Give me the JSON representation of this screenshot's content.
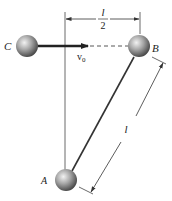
{
  "diagram": {
    "labels": {
      "ball_c": "C",
      "ball_b": "B",
      "ball_a": "A",
      "velocity": "v",
      "velocity_sub": "0",
      "half_length_num": "l",
      "half_length_den": "2",
      "rod_length": "l"
    },
    "colors": {
      "line": "#333333",
      "ball_light": "#e8e8e8",
      "ball_mid": "#9a9a9a",
      "ball_dark": "#4a4a4a",
      "background": "#ffffff"
    }
  }
}
